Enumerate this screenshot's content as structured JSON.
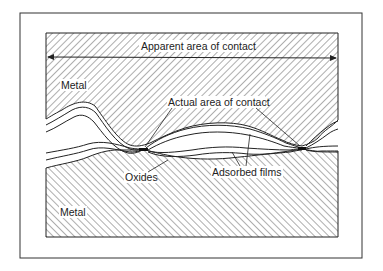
{
  "diagram": {
    "type": "surface-contact cross-section",
    "labels": {
      "apparent_area": "Apparent area of contact",
      "actual_area": "Actual area of contact",
      "metal_top": "Metal",
      "metal_bottom": "Metal",
      "oxides": "Oxides",
      "adsorbed_films": "Adsorbed films"
    },
    "colors": {
      "ink": "#222222",
      "paper": "#ffffff",
      "hatch": "#333333"
    }
  }
}
